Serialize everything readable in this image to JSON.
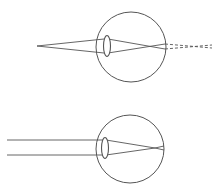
{
  "diagram": {
    "colors": {
      "stroke": "#555555",
      "background": "#ffffff"
    },
    "panels": [
      {
        "id": "near-object",
        "eye": {
          "cx": 131,
          "cy": 47,
          "r": 35
        },
        "lens": {
          "cx": 107,
          "cy": 46,
          "rx": 3.5,
          "ry": 10.5
        },
        "source": {
          "type": "point",
          "x": 37,
          "y": 46
        },
        "rays_into_lens": [
          [
            37,
            46,
            104,
            39
          ],
          [
            37,
            46,
            104,
            53
          ]
        ],
        "rays_in_eye": [
          [
            108,
            39,
            165,
            49
          ],
          [
            108,
            53,
            165,
            44
          ]
        ],
        "virtual_focus_dashed": [
          [
            165,
            44,
            212,
            48
          ],
          [
            165,
            49,
            212,
            45
          ]
        ]
      },
      {
        "id": "distant-object",
        "eye": {
          "cx": 130,
          "cy": 149,
          "r": 34
        },
        "lens": {
          "cx": 105,
          "cy": 148,
          "rx": 3.5,
          "ry": 10.5
        },
        "source": {
          "type": "parallel",
          "y": [
            140,
            155
          ]
        },
        "rays_into_lens": [
          [
            7,
            140,
            103,
            140
          ],
          [
            7,
            155,
            103,
            155
          ]
        ],
        "rays_in_eye": [
          [
            106,
            140,
            155,
            148
          ],
          [
            106,
            155,
            155,
            148
          ]
        ],
        "after_focus": [
          [
            155,
            148,
            164,
            150
          ],
          [
            155,
            148,
            164,
            146
          ]
        ]
      }
    ]
  }
}
